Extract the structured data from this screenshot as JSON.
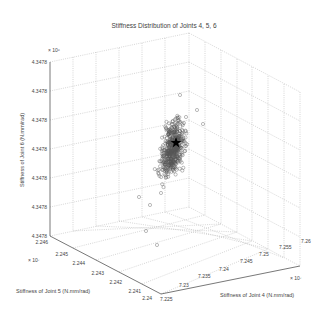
{
  "chart_data": {
    "type": "scatter",
    "dimensions": 3,
    "title": "Stiffness Distribution of Joints 4, 5, 6",
    "xlabel": "Stiffness of Joint 4 (N.mm/rad)",
    "ylabel": "Stiffness of Joint 5 (N.mm/rad)",
    "zlabel": "Stiffness of Joint 6 (N.mm/rad)",
    "x_exponent": "× 10⁷",
    "y_exponent": "× 10⁷",
    "z_exponent": "× 10⁶",
    "x_ticks": [
      "7.225",
      "7.23",
      "7.235",
      "7.24",
      "7.245",
      "7.25",
      "7.255",
      "7.26"
    ],
    "y_ticks": [
      "2.24",
      "2.241",
      "2.242",
      "2.243",
      "2.244",
      "2.245",
      "2.246"
    ],
    "z_ticks": [
      "4.3478",
      "4.3478",
      "4.3478",
      "4.3478",
      "4.3478",
      "4.3478",
      "4.3478"
    ],
    "xlim": [
      7.225,
      7.26
    ],
    "ylim": [
      2.24,
      2.246
    ],
    "grid": true,
    "marker": "open circle",
    "marker_color": "#555555",
    "center_marker": "black star (mean/nominal)",
    "approx_point_count": 500,
    "cluster_description": "Dense elongated vertical cloud centered near x≈7.24e7, y≈2.243e7, spreading mostly along Z"
  },
  "caption": ""
}
